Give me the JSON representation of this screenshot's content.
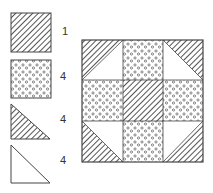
{
  "legend": {
    "items": [
      {
        "shape": "hatched-square",
        "count": "1"
      },
      {
        "shape": "dotted-square",
        "count": "4"
      },
      {
        "shape": "hatched-triangle",
        "count": "4"
      },
      {
        "shape": "plain-triangle",
        "count": "4"
      }
    ]
  },
  "block": {
    "name": "quilt-block",
    "grid": "3x3"
  },
  "colors": {
    "stroke": "#444444",
    "hatch": "#555555",
    "dot": "#555555",
    "background": "#ffffff"
  }
}
